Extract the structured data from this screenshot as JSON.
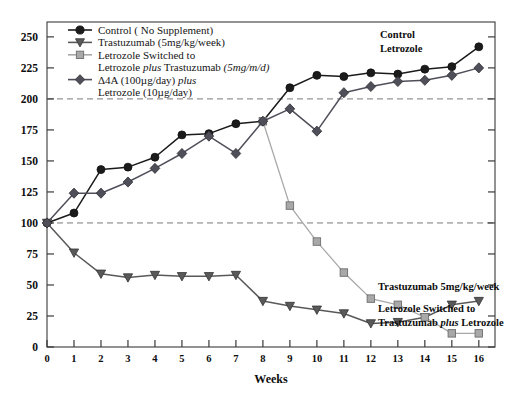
{
  "chart_data": {
    "type": "line",
    "title": "",
    "xlabel": "Weeks",
    "ylabel": "",
    "xlim": [
      0,
      16.6
    ],
    "ylim": [
      0,
      262
    ],
    "x_ticks": [
      0,
      1,
      2,
      3,
      4,
      5,
      6,
      7,
      8,
      9,
      10,
      11,
      12,
      13,
      14,
      15,
      16
    ],
    "y_ticks": [
      0,
      25,
      50,
      75,
      100,
      125,
      150,
      175,
      200,
      225,
      250
    ],
    "grid": "horizontal dashed reference lines at y=100 and y=200",
    "legend_position": "top-left inside plot",
    "series": [
      {
        "name": "Control ( No Supplement)",
        "marker": "circle",
        "color": "#1b1b1b",
        "line_color": "#1b1b1b",
        "x": [
          0,
          1,
          2,
          3,
          4,
          5,
          6,
          7,
          8,
          9,
          10,
          11,
          12,
          13,
          14,
          15,
          16
        ],
        "values": [
          100,
          108,
          143,
          145,
          153,
          171,
          172,
          180,
          182,
          209,
          219,
          218,
          221,
          220,
          224,
          226,
          242
        ]
      },
      {
        "name": "Trastuzumab (5mg/kg/week)",
        "marker": "triangle-down",
        "color": "#595959",
        "line_color": "#595959",
        "x": [
          0,
          1,
          2,
          3,
          4,
          5,
          6,
          7,
          8,
          9,
          10,
          11,
          12,
          13,
          14,
          15,
          16
        ],
        "values": [
          100,
          76,
          59,
          56,
          58,
          57,
          57,
          58,
          37,
          33,
          30,
          27,
          19,
          20,
          24,
          34,
          37
        ]
      },
      {
        "name": "Letrozole Switched to Letrozole plus Trastuzumab (5mg/m/d)",
        "marker": "square",
        "color": "#a8a8a8",
        "line_color": "#a8a8a8",
        "x": [
          8,
          9,
          10,
          11,
          12,
          13,
          14,
          15,
          16
        ],
        "values": [
          182,
          114,
          85,
          60,
          39,
          34,
          24,
          11,
          11
        ]
      },
      {
        "name": "Δ4A (100µg/day) plus Letrozole (10µg/day)",
        "marker": "diamond",
        "color": "#4f4f5a",
        "line_color": "#4f4f5a",
        "x": [
          0,
          1,
          2,
          3,
          4,
          5,
          6,
          7,
          8,
          9,
          10,
          11,
          12,
          13,
          14,
          15,
          16
        ],
        "values": [
          100,
          124,
          124,
          133,
          144,
          156,
          170,
          156,
          182,
          192,
          174,
          205,
          210,
          214,
          215,
          219,
          225
        ]
      }
    ]
  },
  "legend": {
    "items": [
      {
        "marker": "circle",
        "color": "#1b1b1b",
        "lines": [
          [
            {
              "t": "Control ( No Supplement)",
              "i": false
            }
          ]
        ]
      },
      {
        "marker": "triangle-down",
        "color": "#595959",
        "lines": [
          [
            {
              "t": "Trastuzumab (5mg/kg/week)",
              "i": false
            }
          ]
        ]
      },
      {
        "marker": "square",
        "color": "#a8a8a8",
        "lines": [
          [
            {
              "t": "Letrozole Switched to",
              "i": false
            }
          ],
          [
            {
              "t": "Letrozole ",
              "i": false
            },
            {
              "t": "plus",
              "i": true
            },
            {
              "t": " Trastuzumab ",
              "i": false
            },
            {
              "t": "(5mg/m/d)",
              "i": true
            }
          ]
        ]
      },
      {
        "marker": "diamond",
        "color": "#4f4f5a",
        "lines": [
          [
            {
              "t": "Δ4A (100µg/day) ",
              "i": false
            },
            {
              "t": "plus",
              "i": true
            }
          ],
          [
            {
              "t": "Letrozole (10µg/day)",
              "i": false
            }
          ]
        ]
      }
    ]
  },
  "annotations": {
    "control": "Control",
    "letrozole": "Letrozole",
    "trastuzumab": "Trastuzumab 5mg/kg/week",
    "switched_line1": "Letrozole Switched to",
    "switched_line2_a": "Trastuzumab ",
    "switched_line2_b": "plus",
    "switched_line2_c": " Letrozole"
  },
  "axes": {
    "x_title": "Weeks"
  },
  "style": {
    "frame_color": "#3a3a3a",
    "ref_line_color": "#7a7a7a",
    "background": "#ffffff"
  }
}
